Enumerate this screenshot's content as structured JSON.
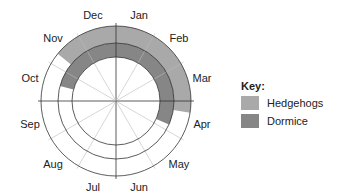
{
  "chart_data": {
    "type": "radial-calendar",
    "title": "",
    "months": [
      "Jan",
      "Feb",
      "Mar",
      "Apr",
      "May",
      "Jun",
      "Jul",
      "Aug",
      "Sep",
      "Oct",
      "Nov",
      "Dec"
    ],
    "series": [
      {
        "name": "Hedgehogs",
        "ring": "outer",
        "color": "#a9a9a9",
        "start_month": "Nov",
        "start_frac": 0.3,
        "end_month": "Apr",
        "end_frac": 0.3
      },
      {
        "name": "Dormice",
        "ring": "middle",
        "color": "#868686",
        "start_month": "Oct",
        "start_frac": 0.5,
        "end_month": "Apr",
        "end_frac": 0.8
      }
    ]
  },
  "key": {
    "title": "Key:",
    "items": [
      {
        "label": "Hedgehogs",
        "color": "#a9a9a9"
      },
      {
        "label": "Dormice",
        "color": "#868686"
      }
    ]
  }
}
